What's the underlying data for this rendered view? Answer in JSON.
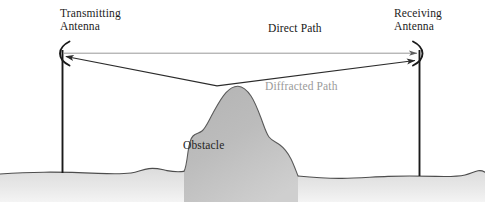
{
  "figure": {
    "width": 485,
    "height": 202,
    "background_color": "#ffffff"
  },
  "labels": {
    "transmitting_antenna": "Transmitting\nAntenna",
    "receiving_antenna": "Receiving\nAntenna",
    "direct_path": "Direct Path",
    "diffracted_path": "Diffracted Path",
    "obstacle": "Obstacle"
  },
  "colors": {
    "text_dark": "#1d1d1d",
    "text_gray": "#9a9a9a",
    "line_dark": "#2b2b2b",
    "line_light": "#8c8c8c",
    "obstacle_fill": "#b9b9b9",
    "obstacle_stroke": "#555555",
    "ground_fill": "#e3e3e3",
    "ground_stroke": "#4d4d4d",
    "mast": "#1a1a1a"
  },
  "geometry": {
    "transmitter_x": 62,
    "receiver_x": 420,
    "antenna_y": 53,
    "mast_bottom_y": 173,
    "peak_x": 217,
    "peak_y": 86,
    "ground_y": 172
  },
  "icons": {
    "transmitting_antenna": "antenna-arc-left",
    "receiving_antenna": "antenna-arc-right",
    "direct_path": "horizontal-line",
    "diffracted_path": "bent-line-arrow"
  }
}
